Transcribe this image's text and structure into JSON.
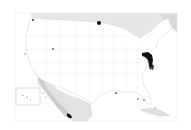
{
  "map": {
    "type": "choropleth",
    "region": "United States (contiguous) with Alaska/Hawaii inset",
    "colors": {
      "background": "#ffffff",
      "land_default": "#ffffff",
      "state_border": "#d8d8d8",
      "foreign_land": "#e4e4e4",
      "water": "#cfcfcf",
      "highlight": "#111111",
      "inset_border": "#bdbdbd",
      "frame": "#e6e6e6"
    },
    "highlighted_areas": [
      {
        "name": "Maryland / Delaware / Virginia shore",
        "shade": "dark"
      },
      {
        "name": "Northern Minnesota point",
        "shade": "dark"
      },
      {
        "name": "Baja California Sur area",
        "shade": "dark"
      },
      {
        "name": "Washington point",
        "shade": "dark"
      },
      {
        "name": "Colorado point",
        "shade": "medium"
      },
      {
        "name": "Northern California point",
        "shade": "medium"
      },
      {
        "name": "Gulf coast points",
        "shade": "medium"
      },
      {
        "name": "Florida points",
        "shade": "medium"
      }
    ],
    "inset": {
      "label": "Hawaii / Pacific inset box"
    }
  }
}
